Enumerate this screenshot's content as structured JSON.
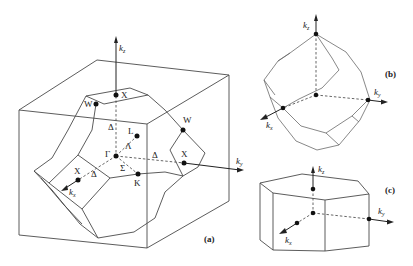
{
  "figure": {
    "panels": [
      {
        "id": "a",
        "label": "(a)",
        "shape": "truncated octahedron (fcc Brillouin zone) in cube",
        "axes": [
          {
            "name": "k",
            "sub": "z"
          },
          {
            "name": "k",
            "sub": "y"
          },
          {
            "name": "k",
            "sub": "x"
          }
        ],
        "points": [
          "X",
          "W",
          "L",
          "Γ",
          "X",
          "W",
          "X",
          "K"
        ],
        "lines": [
          "Δ",
          "Λ",
          "Δ",
          "Σ",
          "Δ"
        ]
      },
      {
        "id": "b",
        "label": "(b)",
        "shape": "rhombic dodecahedron (bcc Brillouin zone)",
        "axes": [
          {
            "name": "k",
            "sub": "z"
          },
          {
            "name": "k",
            "sub": "y"
          },
          {
            "name": "k",
            "sub": "x"
          }
        ]
      },
      {
        "id": "c",
        "label": "(c)",
        "shape": "hexagonal prism",
        "axes": [
          {
            "name": "k",
            "sub": "z"
          },
          {
            "name": "k",
            "sub": "y"
          },
          {
            "name": "k",
            "sub": "x"
          }
        ]
      }
    ]
  },
  "a": {
    "label": "(a)",
    "kz": "k",
    "kz_sub": "z",
    "ky": "k",
    "ky_sub": "y",
    "kx": "k",
    "kx_sub": "x",
    "X_top": "X",
    "W_top": "W",
    "Delta_vert": "Δ",
    "L": "L",
    "Lambda": "Λ",
    "Gamma": "Γ",
    "Delta_right": "Δ",
    "W_right": "W",
    "X_right": "X",
    "X_front": "X",
    "Delta_front": "Δ",
    "Sigma": "Σ",
    "K": "K"
  },
  "b": {
    "label": "(b)",
    "kz": "k",
    "kz_sub": "z",
    "ky": "k",
    "ky_sub": "y",
    "kx": "k",
    "kx_sub": "x"
  },
  "c": {
    "label": "(c)",
    "kz": "k",
    "kz_sub": "z",
    "ky": "k",
    "ky_sub": "y",
    "kx": "k",
    "kx_sub": "x"
  }
}
